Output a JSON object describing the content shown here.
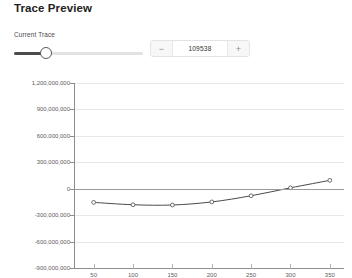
{
  "header": {
    "title": "Trace Preview"
  },
  "control": {
    "label": "Current Trace",
    "slider_fill_percent": 23,
    "stepper": {
      "value": "109538",
      "decrement_label": "−",
      "increment_label": "+"
    }
  },
  "chart_data": {
    "type": "line",
    "title": "",
    "xlabel": "",
    "ylabel": "",
    "xlim": [
      25,
      368
    ],
    "ylim": [
      -900000000,
      1200000000
    ],
    "grid": true,
    "legend": false,
    "zero_line": true,
    "marker": "circle",
    "line_color": "#4a4a4a",
    "yticks": [
      1200000000,
      900000000,
      600000000,
      300000000,
      0,
      -300000000,
      -600000000,
      -900000000
    ],
    "ytick_labels": [
      "1,200,000,000",
      "900,000,000",
      "600,000,000",
      "300,000,000",
      "0",
      "-300,000,000",
      "-600,000,000",
      "-900,000,000"
    ],
    "xticks": [
      50,
      100,
      150,
      200,
      250,
      300,
      350
    ],
    "xtick_labels": [
      "50",
      "100",
      "150",
      "200",
      "250",
      "300",
      "350"
    ],
    "x": [
      50,
      100,
      150,
      200,
      250,
      300,
      350
    ],
    "values": [
      -155000000,
      -182000000,
      -185000000,
      -150000000,
      -80000000,
      10000000,
      95000000
    ],
    "series": [
      {
        "name": "trace",
        "x": [
          50,
          100,
          150,
          200,
          250,
          300,
          350
        ],
        "values": [
          -155000000,
          -182000000,
          -185000000,
          -150000000,
          -80000000,
          10000000,
          95000000
        ]
      }
    ]
  }
}
